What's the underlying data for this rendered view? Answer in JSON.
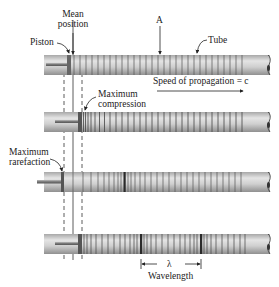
{
  "labels": {
    "mean_position_line1": "Mean",
    "mean_position_line2": "position",
    "piston": "Piston",
    "point_a": "A",
    "tube": "Tube",
    "speed": "Speed of propagation = c",
    "max_compression_line1": "Maximum",
    "max_compression_line2": "compression",
    "max_rarefaction_line1": "Maximum",
    "max_rarefaction_line2": "rarefaction",
    "lambda": "λ",
    "wavelength": "Wavelength"
  },
  "colors": {
    "tube_fill": "#c9c9c9",
    "tube_highlight": "#e6e6e6",
    "tube_shadow": "#8f8f8f",
    "ring_line": "#555555",
    "compression_dark": "#2a2a2a",
    "text": "#222222"
  },
  "tubes": [
    {
      "name": "tube-1-initial",
      "y": 55,
      "rings_start": 70,
      "rings_end": 246,
      "piston_x": 68
    },
    {
      "name": "tube-2-max-compression",
      "y": 112,
      "rings_start": 82,
      "rings_end": 246,
      "piston_x": 79
    },
    {
      "name": "tube-3-max-rarefaction",
      "y": 172,
      "rings_start": 64,
      "rings_end": 246,
      "piston_x": 62
    },
    {
      "name": "tube-4-wavelength",
      "y": 234,
      "rings_start": 80,
      "rings_end": 246,
      "piston_x": 79
    }
  ]
}
